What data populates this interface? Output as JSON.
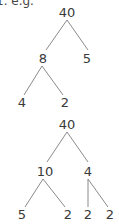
{
  "caption": "1. e.g.",
  "trees": [
    {
      "name": "factor-tree-1",
      "nodes": [
        {
          "id": "root",
          "label": "40",
          "x": 67,
          "y": 17
        },
        {
          "id": "a",
          "label": "8",
          "x": 43,
          "y": 63
        },
        {
          "id": "b",
          "label": "5",
          "x": 87,
          "y": 63
        },
        {
          "id": "c",
          "label": "4",
          "x": 22,
          "y": 107
        },
        {
          "id": "d",
          "label": "2",
          "x": 65,
          "y": 107
        }
      ],
      "edges": [
        {
          "from": [
            67,
            20
          ],
          "to": [
            46,
            50
          ]
        },
        {
          "from": [
            67,
            20
          ],
          "to": [
            88,
            50
          ]
        },
        {
          "from": [
            42,
            66
          ],
          "to": [
            24,
            95
          ]
        },
        {
          "from": [
            42,
            66
          ],
          "to": [
            63,
            95
          ]
        }
      ]
    },
    {
      "name": "factor-tree-2",
      "nodes": [
        {
          "id": "root",
          "label": "40",
          "x": 67,
          "y": 17
        },
        {
          "id": "a",
          "label": "10",
          "x": 45,
          "y": 64
        },
        {
          "id": "b",
          "label": "4",
          "x": 88,
          "y": 64
        },
        {
          "id": "c",
          "label": "5",
          "x": 22,
          "y": 107
        },
        {
          "id": "d",
          "label": "2",
          "x": 68,
          "y": 107
        },
        {
          "id": "e",
          "label": "2",
          "x": 88,
          "y": 107
        },
        {
          "id": "f",
          "label": "2",
          "x": 110,
          "y": 107
        }
      ],
      "edges": [
        {
          "from": [
            67,
            20
          ],
          "to": [
            47,
            50
          ]
        },
        {
          "from": [
            67,
            20
          ],
          "to": [
            88,
            50
          ]
        },
        {
          "from": [
            43,
            67
          ],
          "to": [
            25,
            95
          ]
        },
        {
          "from": [
            43,
            67
          ],
          "to": [
            65,
            95
          ]
        },
        {
          "from": [
            88,
            67
          ],
          "to": [
            88,
            95
          ]
        },
        {
          "from": [
            88,
            67
          ],
          "to": [
            108,
            95
          ]
        }
      ]
    }
  ]
}
